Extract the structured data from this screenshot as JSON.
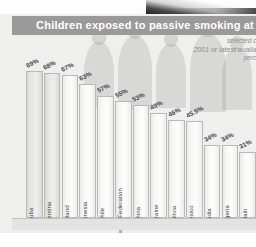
{
  "header": {
    "title": "Children exposed to passive smoking at",
    "title_truncated": true,
    "subtitle_line1": "selected co",
    "subtitle_line2": "2001 or latest availab",
    "subtitle_line3": "perce"
  },
  "colors": {
    "title_band": "#9a9a9a",
    "title_text": "#ffffff",
    "panel_background": "#efefee",
    "bar_fill": "#fdfdfd",
    "bar_border": "#b9b9b7",
    "label_text": "#3f3f3f",
    "subtitle_text": "#8c8c8c"
  },
  "chart_data": {
    "type": "bar",
    "title": "Children exposed to passive smoking at",
    "subtitle": "selected co / 2001 or latest availab / perce",
    "xlabel": "",
    "ylabel": "",
    "ylim": [
      0,
      75
    ],
    "grid": false,
    "legend": "none",
    "orientation": "vertical",
    "categories": [
      "Cuba",
      "Argentina",
      "Poland",
      "Indonesia",
      "Chile",
      "Russian Federation",
      "China",
      "Ukraine",
      "Bolivia",
      "Mexico",
      "India",
      "Nigeria",
      "Haiti"
    ],
    "values": [
      69,
      68,
      67,
      63,
      57,
      55,
      53,
      49,
      46,
      45.5,
      34,
      34,
      31
    ],
    "value_labels": [
      "69%",
      "68%",
      "67%",
      "63%",
      "57%",
      "55%",
      "53%",
      "49%",
      "46%",
      "45.5%",
      "34%",
      "34%",
      "31%"
    ]
  }
}
